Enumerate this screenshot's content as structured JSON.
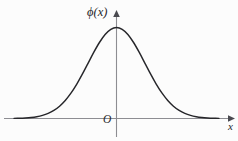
{
  "figure": {
    "title": "",
    "background_color": "#fcfcfc",
    "curve_color": "#26262a",
    "axis_color": "#8d8d92",
    "label_color": "#26262a",
    "labels": {
      "y_axis": "ϕ(x)",
      "x_axis": "x",
      "origin": "O"
    }
  },
  "chart_data": {
    "type": "line",
    "title": "",
    "subtitle": "",
    "xlabel": "x",
    "ylabel": "ϕ(x)",
    "function": "phi(x) = (1/sqrt(2*pi)) * exp(-x^2/2)",
    "grid": false,
    "legend": null,
    "legend_position": "none",
    "xlim": [
      -3.6,
      3.6
    ],
    "ylim": [
      0,
      0.45
    ],
    "x_ticks": [],
    "y_ticks": [],
    "origin_label": "O",
    "series": [
      {
        "name": "ϕ(x)",
        "color": "#26262a",
        "x": [
          -3.6,
          -3.4,
          -3.2,
          -3.0,
          -2.8,
          -2.6,
          -2.4,
          -2.2,
          -2.0,
          -1.8,
          -1.6,
          -1.4,
          -1.2,
          -1.0,
          -0.8,
          -0.6,
          -0.4,
          -0.2,
          0.0,
          0.2,
          0.4,
          0.6,
          0.8,
          1.0,
          1.2,
          1.4,
          1.6,
          1.8,
          2.0,
          2.2,
          2.4,
          2.6,
          2.8,
          3.0,
          3.2,
          3.4,
          3.6
        ],
        "values": [
          0.0006,
          0.0012,
          0.0024,
          0.0044,
          0.0079,
          0.0136,
          0.0224,
          0.0355,
          0.054,
          0.079,
          0.1109,
          0.1497,
          0.1942,
          0.242,
          0.2897,
          0.3332,
          0.3683,
          0.391,
          0.3989,
          0.391,
          0.3683,
          0.3332,
          0.2897,
          0.242,
          0.1942,
          0.1497,
          0.1109,
          0.079,
          0.054,
          0.0355,
          0.0224,
          0.0136,
          0.0079,
          0.0044,
          0.0024,
          0.0012,
          0.0006
        ]
      }
    ],
    "annotations": [
      {
        "text": "ϕ(x)",
        "role": "y-axis-label",
        "x": 0,
        "y": 0.45
      },
      {
        "text": "x",
        "role": "x-axis-label",
        "x": 3.6,
        "y": 0
      },
      {
        "text": "O",
        "role": "origin-label",
        "x": 0,
        "y": 0
      }
    ]
  }
}
